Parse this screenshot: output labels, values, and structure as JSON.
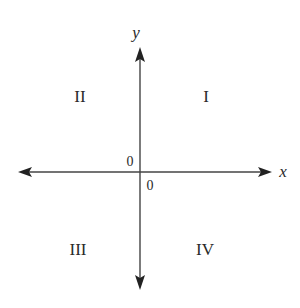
{
  "diagram": {
    "type": "coordinate-plane",
    "axes": {
      "x_label": "x",
      "y_label": "y"
    },
    "origin_labels": {
      "upper_left": "0",
      "lower_right": "0"
    },
    "quadrants": {
      "q1": "I",
      "q2": "II",
      "q3": "III",
      "q4": "IV"
    },
    "colors": {
      "axis": "#444444",
      "text": "#2a2a2a",
      "background": "#ffffff"
    }
  }
}
